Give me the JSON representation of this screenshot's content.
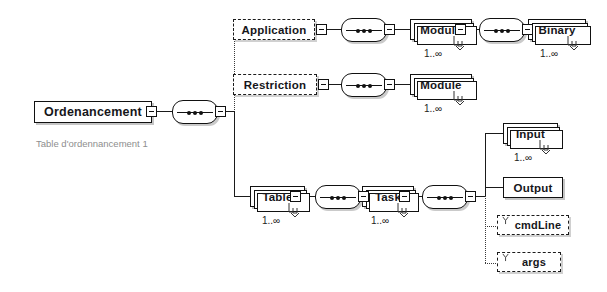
{
  "diagram": {
    "root": {
      "label": "Ordenancement",
      "caption": "Table d'ordennancement 1"
    },
    "occurrence_unbounded": "1..∞",
    "nodes": {
      "application": {
        "label": "Application",
        "optional": true,
        "occurrence": ""
      },
      "module_app": {
        "label": "Module",
        "optional": false,
        "occurrence": "1..∞"
      },
      "binary": {
        "label": "Binary",
        "optional": false,
        "occurrence": "1..∞"
      },
      "restriction": {
        "label": "Restriction",
        "optional": true,
        "occurrence": ""
      },
      "module_res": {
        "label": "Module",
        "optional": false,
        "occurrence": "1..∞"
      },
      "table": {
        "label": "Table",
        "optional": false,
        "occurrence": "1..∞"
      },
      "task": {
        "label": "Task",
        "optional": false,
        "occurrence": "1..∞"
      },
      "input": {
        "label": "Input",
        "optional": false,
        "occurrence": "1..∞"
      },
      "output": {
        "label": "Output",
        "optional": false,
        "occurrence": ""
      },
      "cmdline": {
        "label": "cmdLine",
        "optional": true,
        "occurrence": ""
      },
      "args": {
        "label": "args",
        "optional": true,
        "occurrence": ""
      }
    },
    "icons": {
      "sequence": "sequence-compositor-icon",
      "collapse": "collapse-toggle-icon",
      "attribute": "attribute-marker-icon"
    },
    "colors": {
      "stroke": "#111111",
      "shadow": "#969696",
      "caption": "#8e8e8e",
      "background": "#ffffff"
    }
  }
}
